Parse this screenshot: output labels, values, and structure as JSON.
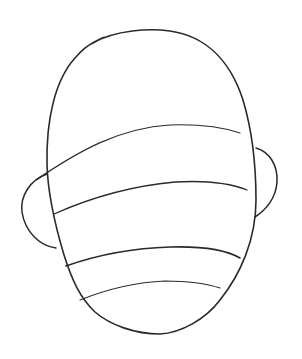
{
  "image": {
    "description": "Pencil line drawing of a bald head outline viewed from behind/front with ears and four horizontal guide lines",
    "background": "#ffffff",
    "stroke_color": "#2a2a2a"
  },
  "elements": [
    {
      "name": "head-outline"
    },
    {
      "name": "left-ear"
    },
    {
      "name": "right-ear"
    },
    {
      "name": "guide-line-1"
    },
    {
      "name": "guide-line-2"
    },
    {
      "name": "guide-line-3"
    },
    {
      "name": "guide-line-4"
    }
  ]
}
